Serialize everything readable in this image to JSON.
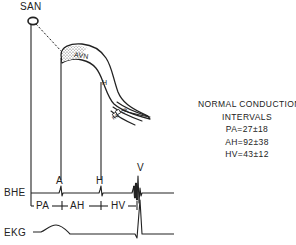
{
  "diagram": {
    "nodes": {
      "san": "SAN",
      "avn": "AVN",
      "his": "H",
      "rb": "RB",
      "lb": "LB"
    },
    "traces": {
      "bhe": "BHE",
      "ekg": "EKG"
    },
    "deflections": {
      "a": "A",
      "h": "H",
      "v": "V"
    },
    "interval_markers": {
      "pa": "PA",
      "ah": "AH",
      "hv": "HV"
    },
    "legend": {
      "title_line1": "NORMAL CONDUCTION",
      "title_line2": "INTERVALS",
      "values": [
        {
          "label": "PA=27±18"
        },
        {
          "label": "AH=92±38"
        },
        {
          "label": "HV=43±12"
        }
      ]
    },
    "colors": {
      "ink": "#222222",
      "background": "#ffffff"
    }
  }
}
